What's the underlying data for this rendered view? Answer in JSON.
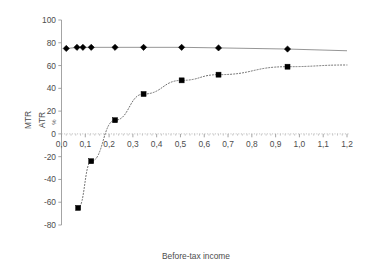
{
  "chart_data": {
    "type": "line",
    "title": "",
    "subtitle": "",
    "xlabel": "Before-tax income",
    "ylabel": "MTR",
    "ylabel2": "ATR",
    "ylabel_unit": "%",
    "xlim": [
      0.0,
      1.2
    ],
    "ylim": [
      -80,
      100
    ],
    "grid": false,
    "legend_position": "none",
    "xticks": [
      "0,0",
      "0,1",
      "0,2",
      "0,3",
      "0,4",
      "0,5",
      "0,6",
      "0,7",
      "0,8",
      "0,9",
      "1,0",
      "1,1",
      "1,2"
    ],
    "xtick_values": [
      0.0,
      0.1,
      0.2,
      0.3,
      0.4,
      0.5,
      0.6,
      0.7,
      0.8,
      0.9,
      1.0,
      1.1,
      1.2
    ],
    "yticks": [
      "100",
      "80",
      "60",
      "40",
      "20",
      "0",
      "-20",
      "-40",
      "-60",
      "-80"
    ],
    "ytick_values": [
      100,
      80,
      60,
      40,
      20,
      0,
      -20,
      -40,
      -60,
      -80
    ],
    "series": [
      {
        "name": "MTR",
        "marker": "diamond",
        "linestyle": "solid",
        "color": "#000000",
        "line_color": "#8a8a8a",
        "x": [
          0.02,
          0.07,
          0.1,
          0.14,
          0.22,
          0.35,
          0.51,
          0.66,
          0.95,
          1.2
        ],
        "values": [
          75.0,
          76.0,
          76.0,
          76.0,
          76.0,
          76.0,
          76.0,
          75.5,
          74.5,
          73.0
        ]
      },
      {
        "name": "ATR",
        "marker": "square",
        "linestyle": "dotted",
        "color": "#000000",
        "line_color": "#6e6e6e",
        "x": [
          0.07,
          0.1,
          0.14,
          0.22,
          0.35,
          0.51,
          0.66,
          0.95,
          1.2
        ],
        "values": [
          -65.0,
          -24.0,
          -24.0,
          12.0,
          35.0,
          47.0,
          52.0,
          59.0,
          60.5
        ]
      }
    ],
    "atr_points": [
      {
        "x": 0.07,
        "y": -65.0
      },
      {
        "x": 0.125,
        "y": -24.0
      },
      {
        "x": 0.225,
        "y": 12.0
      },
      {
        "x": 0.345,
        "y": 35.0
      },
      {
        "x": 0.505,
        "y": 47.0
      },
      {
        "x": 0.66,
        "y": 52.0
      },
      {
        "x": 0.95,
        "y": 59.0
      },
      {
        "x": 1.2,
        "y": 60.5
      }
    ],
    "mtr_points": [
      {
        "x": 0.02,
        "y": 75.0
      },
      {
        "x": 0.065,
        "y": 76.0
      },
      {
        "x": 0.09,
        "y": 76.0
      },
      {
        "x": 0.125,
        "y": 76.0
      },
      {
        "x": 0.225,
        "y": 76.0
      },
      {
        "x": 0.345,
        "y": 76.0
      },
      {
        "x": 0.505,
        "y": 76.0
      },
      {
        "x": 0.66,
        "y": 75.5
      },
      {
        "x": 0.95,
        "y": 74.5
      }
    ],
    "zero_crossing_x": 0.19
  }
}
